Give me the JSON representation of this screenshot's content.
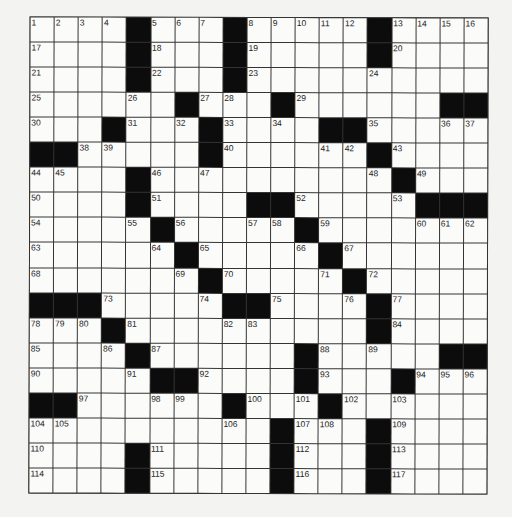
{
  "puzzle": {
    "rows": 19,
    "cols": 19,
    "colors": {
      "block": "#0c0c0c",
      "cell": "#fbfbfa",
      "line": "#333333",
      "background": "#f3f3f2"
    },
    "grid": [
      [
        "1",
        "2",
        "3",
        "4",
        "#",
        "5",
        "6",
        "7",
        "#",
        "8",
        "9",
        "10",
        "11",
        "12",
        "#",
        "13",
        "14",
        "15",
        "16"
      ],
      [
        "17",
        "",
        "",
        "",
        "#",
        "18",
        "",
        "",
        "#",
        "19",
        "",
        "",
        "",
        "",
        "#",
        "20",
        "",
        "",
        ""
      ],
      [
        "21",
        "",
        "",
        "",
        "#",
        "22",
        "",
        "",
        "#",
        "23",
        "",
        "",
        "",
        "",
        "24",
        "",
        "",
        "",
        ""
      ],
      [
        "25",
        "",
        "",
        "",
        "26",
        "",
        "#",
        "27",
        "28",
        "",
        "#",
        "29",
        "",
        "",
        "",
        "",
        "",
        "#",
        "#"
      ],
      [
        "30",
        "",
        "",
        "#",
        "31",
        "",
        "32",
        "#",
        "33",
        "",
        "34",
        "",
        "#",
        "#",
        "35",
        "",
        "",
        "36",
        "37"
      ],
      [
        "#",
        "#",
        "38",
        "39",
        "",
        "",
        "",
        "#",
        "40",
        "",
        "",
        "",
        "41",
        "42",
        "#",
        "43",
        "",
        "",
        ""
      ],
      [
        "44",
        "45",
        "",
        "",
        "#",
        "46",
        "",
        "47",
        "",
        "",
        "",
        "",
        "",
        "",
        "48",
        "#",
        "49",
        "",
        ""
      ],
      [
        "50",
        "",
        "",
        "",
        "#",
        "51",
        "",
        "",
        "",
        "#",
        "#",
        "52",
        "",
        "",
        "",
        "53",
        "#",
        "#",
        "#"
      ],
      [
        "54",
        "",
        "",
        "",
        "55",
        "#",
        "56",
        "",
        "",
        "57",
        "58",
        "#",
        "59",
        "",
        "",
        "",
        "60",
        "61",
        "62"
      ],
      [
        "63",
        "",
        "",
        "",
        "",
        "64",
        "#",
        "65",
        "",
        "",
        "",
        "66",
        "#",
        "67",
        "",
        "",
        "",
        "",
        ""
      ],
      [
        "68",
        "",
        "",
        "",
        "",
        "",
        "69",
        "#",
        "70",
        "",
        "",
        "",
        "71",
        "#",
        "72",
        "",
        "",
        "",
        ""
      ],
      [
        "#",
        "#",
        "#",
        "73",
        "",
        "",
        "",
        "74",
        "#",
        "#",
        "75",
        "",
        "",
        "76",
        "#",
        "77",
        "",
        "",
        ""
      ],
      [
        "78",
        "79",
        "80",
        "#",
        "81",
        "",
        "",
        "",
        "82",
        "83",
        "",
        "",
        "",
        "",
        "#",
        "84",
        "",
        "",
        ""
      ],
      [
        "85",
        "",
        "",
        "86",
        "#",
        "87",
        "",
        "",
        "",
        "",
        "",
        "#",
        "88",
        "",
        "89",
        "",
        "",
        "#",
        "#"
      ],
      [
        "90",
        "",
        "",
        "",
        "91",
        "#",
        "#",
        "92",
        "",
        "",
        "",
        "#",
        "93",
        "",
        "",
        "#",
        "94",
        "95",
        "96"
      ],
      [
        "#",
        "#",
        "97",
        "",
        "",
        "98",
        "99",
        "",
        "#",
        "100",
        "",
        "101",
        "#",
        "102",
        "",
        "103",
        "",
        "",
        ""
      ],
      [
        "104",
        "105",
        "",
        "",
        "",
        "",
        "",
        "",
        "106",
        "",
        "#",
        "107",
        "108",
        "",
        "#",
        "109",
        "",
        "",
        ""
      ],
      [
        "110",
        "",
        "",
        "",
        "#",
        "111",
        "",
        "",
        "",
        "",
        "#",
        "112",
        "",
        "",
        "#",
        "113",
        "",
        "",
        ""
      ],
      [
        "114",
        "",
        "",
        "",
        "#",
        "115",
        "",
        "",
        "",
        "",
        "#",
        "116",
        "",
        "",
        "#",
        "117",
        "",
        "",
        ""
      ]
    ]
  }
}
